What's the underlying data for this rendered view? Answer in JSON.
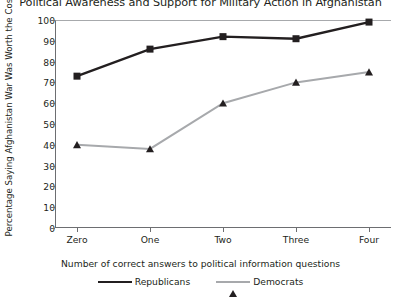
{
  "chart_data": {
    "type": "line",
    "title": "Political Awareness and Support for Military Action in Afghanistan",
    "xlabel": "Number of correct answers to political information questions",
    "ylabel": "Percentage Saying Afghanistan War Was Worth the Cost",
    "categories": [
      "Zero",
      "One",
      "Two",
      "Three",
      "Four"
    ],
    "ylim": [
      0,
      100
    ],
    "yticks": [
      0,
      10,
      20,
      30,
      40,
      50,
      60,
      70,
      80,
      90,
      100
    ],
    "grid": false,
    "legend_position": "bottom",
    "series": [
      {
        "name": "Republicans",
        "values": [
          73,
          86,
          92,
          91,
          99
        ],
        "color": "#231f20",
        "marker": "square"
      },
      {
        "name": "Democrats",
        "values": [
          40,
          38,
          60,
          70,
          75
        ],
        "color": "#a7a9ac",
        "marker": "triangle"
      }
    ]
  }
}
